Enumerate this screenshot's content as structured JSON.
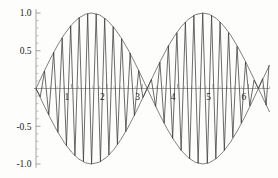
{
  "chart_data": {
    "type": "line",
    "title": "",
    "subtitle": "",
    "xlabel": "",
    "ylabel": "",
    "xlim": [
      0,
      6.6
    ],
    "ylim": [
      -1.05,
      1.05
    ],
    "grid": false,
    "legend": null,
    "x_ticks_major": [
      1,
      2,
      3,
      4,
      5,
      6
    ],
    "x_tick_labels": [
      "1",
      "2",
      "3",
      "4",
      "5",
      "6"
    ],
    "x_tick_minor_step": 0.2,
    "y_ticks_major": [
      -1.0,
      -0.5,
      0.5,
      1.0
    ],
    "y_tick_labels": [
      "-1.0",
      "-0.5",
      "0.5",
      "1.0"
    ],
    "y_tick_minor_step": 0.1,
    "series": [
      {
        "name": "envelope-upper",
        "formula": "y = |sin(x)|  upper bound",
        "kind": "envelope",
        "values": [
          [
            0.0,
            0.0
          ],
          [
            0.2,
            0.199
          ],
          [
            0.4,
            0.389
          ],
          [
            0.6,
            0.565
          ],
          [
            0.8,
            0.717
          ],
          [
            1.0,
            0.841
          ],
          [
            1.2,
            0.932
          ],
          [
            1.4,
            0.985
          ],
          [
            1.5708,
            1.0
          ],
          [
            1.8,
            0.974
          ],
          [
            2.0,
            0.909
          ],
          [
            2.2,
            0.808
          ],
          [
            2.4,
            0.675
          ],
          [
            2.6,
            0.516
          ],
          [
            2.8,
            0.335
          ],
          [
            3.0,
            0.141
          ],
          [
            3.1416,
            0.0
          ],
          [
            3.3,
            0.158
          ],
          [
            3.5,
            0.351
          ],
          [
            3.7,
            0.53
          ],
          [
            3.9,
            0.688
          ],
          [
            4.1,
            0.818
          ],
          [
            4.3,
            0.916
          ],
          [
            4.5,
            0.978
          ],
          [
            4.7124,
            1.0
          ],
          [
            4.9,
            0.982
          ],
          [
            5.1,
            0.926
          ],
          [
            5.3,
            0.832
          ],
          [
            5.5,
            0.706
          ],
          [
            5.7,
            0.551
          ],
          [
            5.9,
            0.374
          ],
          [
            6.1,
            0.182
          ],
          [
            6.2832,
            0.0
          ],
          [
            6.45,
            0.166
          ],
          [
            6.6,
            0.312
          ]
        ]
      },
      {
        "name": "envelope-lower",
        "formula": "y = -|sin(x)|  lower bound",
        "kind": "envelope",
        "values": [
          [
            0.0,
            0.0
          ],
          [
            0.2,
            -0.199
          ],
          [
            0.4,
            -0.389
          ],
          [
            0.6,
            -0.565
          ],
          [
            0.8,
            -0.717
          ],
          [
            1.0,
            -0.841
          ],
          [
            1.2,
            -0.932
          ],
          [
            1.4,
            -0.985
          ],
          [
            1.5708,
            -1.0
          ],
          [
            1.8,
            -0.974
          ],
          [
            2.0,
            -0.909
          ],
          [
            2.2,
            -0.808
          ],
          [
            2.4,
            -0.675
          ],
          [
            2.6,
            -0.516
          ],
          [
            2.8,
            -0.335
          ],
          [
            3.0,
            -0.141
          ],
          [
            3.1416,
            0.0
          ],
          [
            3.3,
            -0.158
          ],
          [
            3.5,
            -0.351
          ],
          [
            3.7,
            -0.53
          ],
          [
            3.9,
            -0.688
          ],
          [
            4.1,
            -0.818
          ],
          [
            4.3,
            -0.916
          ],
          [
            4.5,
            -0.978
          ],
          [
            4.7124,
            -1.0
          ],
          [
            4.9,
            -0.982
          ],
          [
            5.1,
            -0.926
          ],
          [
            5.3,
            -0.832
          ],
          [
            5.5,
            -0.706
          ],
          [
            5.7,
            -0.551
          ],
          [
            5.9,
            -0.374
          ],
          [
            6.1,
            -0.182
          ],
          [
            6.2832,
            0.0
          ],
          [
            6.45,
            -0.166
          ],
          [
            6.6,
            -0.312
          ]
        ]
      },
      {
        "name": "aliased-sine",
        "formula": "y = sin(x) * sin(k x) sampled coarsely",
        "kind": "polyline",
        "values": [
          [
            0.0,
            0.0
          ],
          [
            0.12,
            -0.11
          ],
          [
            0.24,
            0.23
          ],
          [
            0.36,
            -0.35
          ],
          [
            0.5,
            0.48
          ],
          [
            0.62,
            -0.58
          ],
          [
            0.74,
            0.67
          ],
          [
            0.86,
            -0.76
          ],
          [
            0.98,
            0.83
          ],
          [
            1.1,
            -0.89
          ],
          [
            1.22,
            0.94
          ],
          [
            1.34,
            -0.97
          ],
          [
            1.46,
            0.99
          ],
          [
            1.57,
            -1.0
          ],
          [
            1.7,
            0.99
          ],
          [
            1.82,
            -0.97
          ],
          [
            1.94,
            0.93
          ],
          [
            2.06,
            -0.88
          ],
          [
            2.18,
            0.82
          ],
          [
            2.3,
            -0.74
          ],
          [
            2.42,
            0.66
          ],
          [
            2.54,
            -0.57
          ],
          [
            2.66,
            0.47
          ],
          [
            2.78,
            -0.36
          ],
          [
            2.9,
            0.24
          ],
          [
            3.02,
            -0.12
          ],
          [
            3.14,
            0.0
          ],
          [
            3.26,
            0.12
          ],
          [
            3.38,
            -0.24
          ],
          [
            3.5,
            0.35
          ],
          [
            3.62,
            -0.46
          ],
          [
            3.74,
            0.57
          ],
          [
            3.86,
            -0.66
          ],
          [
            3.98,
            0.74
          ],
          [
            4.1,
            -0.82
          ],
          [
            4.22,
            0.88
          ],
          [
            4.34,
            -0.93
          ],
          [
            4.46,
            0.97
          ],
          [
            4.58,
            -0.99
          ],
          [
            4.71,
            1.0
          ],
          [
            4.84,
            -0.99
          ],
          [
            4.96,
            0.97
          ],
          [
            5.08,
            -0.93
          ],
          [
            5.2,
            0.88
          ],
          [
            5.32,
            -0.82
          ],
          [
            5.44,
            0.74
          ],
          [
            5.56,
            -0.65
          ],
          [
            5.68,
            0.56
          ],
          [
            5.8,
            -0.46
          ],
          [
            5.92,
            0.35
          ],
          [
            6.04,
            -0.23
          ],
          [
            6.16,
            0.11
          ],
          [
            6.28,
            0.0
          ],
          [
            6.4,
            0.13
          ],
          [
            6.5,
            -0.22
          ],
          [
            6.58,
            0.3
          ]
        ]
      }
    ]
  }
}
